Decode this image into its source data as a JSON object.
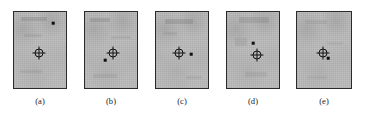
{
  "figure": {
    "type": "image-panel-series",
    "caption_labels": [
      "(a)",
      "(b)",
      "(c)",
      "(d)",
      "(e)"
    ],
    "panel_count": 5,
    "colors": {
      "plate_fill": "#bcbcbc",
      "plate_border": "#2a2a2a",
      "marker": "#121212",
      "dot": "#0d0d0d",
      "background": "#ffffff",
      "label_text": "#1a1a1a"
    },
    "marker_legend": {
      "crosshair": "crosshair-target-marker",
      "dot": "point-estimate-dot"
    },
    "panels": [
      {
        "label": "(a)",
        "x": 13,
        "y": 11,
        "w": 54,
        "h": 78,
        "crosshair": {
          "cx": 25,
          "cy": 41
        },
        "dot": {
          "cx": 39,
          "cy": 11
        },
        "label_x": 40,
        "label_y": 96
      },
      {
        "label": "(b)",
        "x": 84,
        "y": 11,
        "w": 54,
        "h": 78,
        "crosshair": {
          "cx": 28,
          "cy": 41
        },
        "dot": {
          "cx": 20,
          "cy": 48
        },
        "label_x": 111,
        "label_y": 96
      },
      {
        "label": "(c)",
        "x": 155,
        "y": 11,
        "w": 54,
        "h": 78,
        "crosshair": {
          "cx": 23,
          "cy": 41
        },
        "dot": {
          "cx": 35,
          "cy": 42
        },
        "label_x": 182,
        "label_y": 96
      },
      {
        "label": "(d)",
        "x": 226,
        "y": 11,
        "w": 54,
        "h": 78,
        "crosshair": {
          "cx": 30,
          "cy": 43
        },
        "dot": {
          "cx": 26,
          "cy": 31
        },
        "label_x": 253,
        "label_y": 96
      },
      {
        "label": "(e)",
        "x": 296,
        "y": 11,
        "w": 56,
        "h": 78,
        "crosshair": {
          "cx": 26,
          "cy": 41
        },
        "dot": {
          "cx": 31,
          "cy": 46
        },
        "label_x": 324,
        "label_y": 96
      }
    ]
  }
}
